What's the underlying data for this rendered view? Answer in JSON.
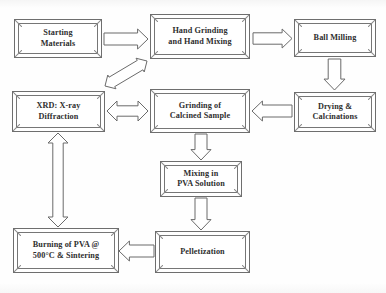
{
  "diagram": {
    "background_color": "#fefefe",
    "box_border_color": "#6e6e6e",
    "box_fill_color": "#ffffff",
    "text_color": "#2e2e2e",
    "arrow_stroke_color": "#6a6a6a",
    "arrow_fill_color": "#ffffff",
    "nodes": [
      {
        "id": "starting-materials",
        "label": "Starting\nMaterials",
        "x": 14,
        "y": 19,
        "w": 88,
        "h": 39
      },
      {
        "id": "hand-grinding",
        "label": "Hand Grinding\nand Hand Mixing",
        "x": 150,
        "y": 14,
        "w": 100,
        "h": 45
      },
      {
        "id": "ball-milling",
        "label": "Ball Milling",
        "x": 294,
        "y": 19,
        "w": 82,
        "h": 38
      },
      {
        "id": "drying-calcinations",
        "label": "Drying &\nCalcinations",
        "x": 294,
        "y": 92,
        "w": 82,
        "h": 40
      },
      {
        "id": "grinding-calcined",
        "label": "Grinding of\nCalcined Sample",
        "x": 150,
        "y": 89,
        "w": 100,
        "h": 44
      },
      {
        "id": "xrd-diffraction",
        "label": "XRD: X-ray\nDiffraction",
        "x": 12,
        "y": 91,
        "w": 93,
        "h": 41
      },
      {
        "id": "mixing-pva",
        "label": "Mixing in\nPVA Solution",
        "x": 160,
        "y": 161,
        "w": 82,
        "h": 36
      },
      {
        "id": "pelletization",
        "label": "Pelletization",
        "x": 155,
        "y": 231,
        "w": 95,
        "h": 42
      },
      {
        "id": "burning-pva",
        "label": "Burning of PVA @\n500°C & Sintering",
        "x": 13,
        "y": 228,
        "w": 106,
        "h": 45
      }
    ],
    "arrows": [
      {
        "id": "arrow-starting-to-handgrinding",
        "from": "starting-materials",
        "to": "hand-grinding",
        "direction": "right",
        "x": 104,
        "y": 29,
        "w": 44,
        "h": 20
      },
      {
        "id": "arrow-handgrinding-to-ballmilling",
        "from": "hand-grinding",
        "to": "ball-milling",
        "direction": "right",
        "x": 253,
        "y": 29,
        "w": 39,
        "h": 19
      },
      {
        "id": "arrow-ballmilling-to-drying",
        "from": "ball-milling",
        "to": "drying-calcinations",
        "direction": "down",
        "x": 324,
        "y": 59,
        "w": 21,
        "h": 31
      },
      {
        "id": "arrow-drying-to-grinding",
        "from": "drying-calcinations",
        "to": "grinding-calcined",
        "direction": "left",
        "x": 252,
        "y": 101,
        "w": 40,
        "h": 20
      },
      {
        "id": "arrow-grinding-to-xrd",
        "from": "grinding-calcined",
        "to": "xrd-diffraction",
        "direction": "double-horizontal",
        "x": 107,
        "y": 101,
        "w": 41,
        "h": 20
      },
      {
        "id": "arrow-xrd-to-handgrinding",
        "from": "xrd-diffraction",
        "to": "hand-grinding",
        "direction": "double-diagonal",
        "x": 100,
        "y": 56,
        "w": 52,
        "h": 35
      },
      {
        "id": "arrow-grinding-to-mixing",
        "from": "grinding-calcined",
        "to": "mixing-pva",
        "direction": "down",
        "x": 191,
        "y": 134,
        "w": 20,
        "h": 26
      },
      {
        "id": "arrow-mixing-to-pelletization",
        "from": "mixing-pva",
        "to": "pelletization",
        "direction": "down",
        "x": 191,
        "y": 198,
        "w": 20,
        "h": 32
      },
      {
        "id": "arrow-pelletization-to-burning",
        "from": "pelletization",
        "to": "burning-pva",
        "direction": "left",
        "x": 119,
        "y": 241,
        "w": 35,
        "h": 20
      },
      {
        "id": "arrow-burning-to-xrd",
        "from": "burning-pva",
        "to": "xrd-diffraction",
        "direction": "double-vertical",
        "x": 48,
        "y": 133,
        "w": 20,
        "h": 94
      }
    ]
  }
}
